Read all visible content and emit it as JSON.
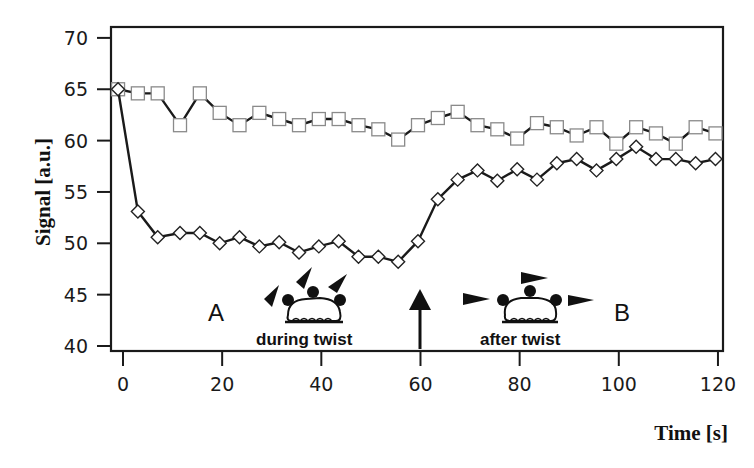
{
  "chart_data": {
    "type": "line",
    "title": "",
    "xlabel": "Time [s]",
    "ylabel": "Signal [a.u.]",
    "xlim": [
      -1,
      121
    ],
    "ylim": [
      40,
      70
    ],
    "xticks": [
      0,
      20,
      40,
      60,
      80,
      100,
      120
    ],
    "yticks": [
      40,
      45,
      50,
      55,
      60,
      65,
      70
    ],
    "grid": false,
    "legend": null,
    "series": [
      {
        "name": "squares",
        "marker": "square",
        "x": [
          -1,
          3,
          7,
          11.5,
          15.5,
          19.5,
          23.5,
          27.5,
          31.5,
          35.5,
          39.5,
          43.5,
          47.5,
          51.5,
          55.5,
          59.5,
          63.5,
          67.5,
          71.5,
          75.5,
          79.5,
          83.5,
          87.5,
          91.5,
          95.5,
          99.5,
          103.5,
          107.5,
          111.5,
          115.5,
          119.5
        ],
        "values": [
          65.0,
          64.6,
          64.6,
          61.5,
          64.6,
          62.7,
          61.5,
          62.7,
          62.1,
          61.5,
          62.1,
          62.1,
          61.5,
          61.1,
          60.1,
          61.5,
          62.2,
          62.8,
          61.5,
          61.1,
          60.2,
          61.7,
          61.3,
          60.5,
          61.3,
          59.7,
          61.3,
          60.7,
          59.7,
          61.3,
          60.7
        ]
      },
      {
        "name": "diamonds",
        "marker": "diamond",
        "x": [
          -1,
          3,
          7,
          11.5,
          15.5,
          19.5,
          23.5,
          27.5,
          31.5,
          35.5,
          39.5,
          43.5,
          47.5,
          51.5,
          55.5,
          59.5,
          63.5,
          67.5,
          71.5,
          75.5,
          79.5,
          83.5,
          87.5,
          91.5,
          95.5,
          99.5,
          103.5,
          107.5,
          111.5,
          115.5,
          119.5
        ],
        "values": [
          65.0,
          53.1,
          50.6,
          51.0,
          51.0,
          50.0,
          50.6,
          49.7,
          50.1,
          49.1,
          49.7,
          50.2,
          48.7,
          48.7,
          48.2,
          50.2,
          54.3,
          56.2,
          57.1,
          56.1,
          57.2,
          56.2,
          57.8,
          58.2,
          57.1,
          58.2,
          59.4,
          58.2,
          58.2,
          57.8,
          58.2
        ]
      }
    ],
    "annotations": [
      {
        "text": "A",
        "x": 20,
        "y": 43
      },
      {
        "text": "during twist",
        "x": 40,
        "y": 40.6
      },
      {
        "text": "after twist",
        "x": 85,
        "y": 40.6
      },
      {
        "text": "B",
        "x": 110,
        "y": 43
      },
      {
        "type": "arrow-up",
        "x": 60,
        "y_from": 40.2,
        "y_to": 45.6
      }
    ]
  },
  "axes": {
    "xlabel": "Time [s]",
    "ylabel": "Signal [a.u.]"
  },
  "annotations": {
    "label_a": "A",
    "label_b": "B",
    "caption_during": "during twist",
    "caption_after": "after twist"
  },
  "colors": {
    "line": "#1a1a1a",
    "marker_fill": "#ffffff",
    "square_stroke": "#8a8a8a",
    "diamond_stroke": "#222222",
    "frame": "#1a1a1a"
  }
}
